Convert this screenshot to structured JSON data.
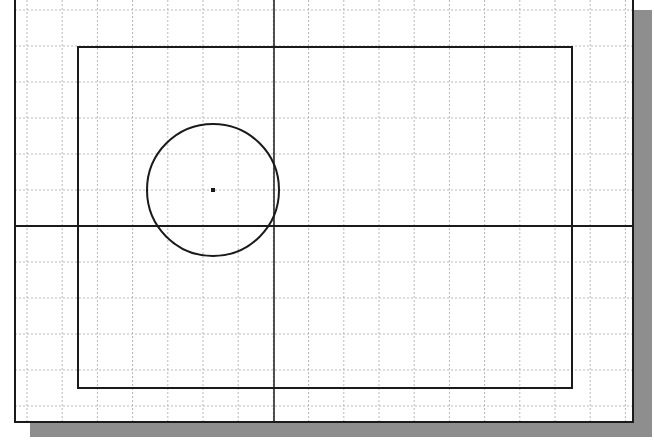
{
  "canvas": {
    "width": 654,
    "height": 446,
    "background": "#ffffff"
  },
  "colors": {
    "line": "#1a1a1a",
    "grid": "#b8b8b8",
    "shadow": "#8e8e8e"
  },
  "drawing_area": {
    "left": 15,
    "top": -4,
    "right": 633,
    "bottom": 422,
    "shadow": {
      "offset_x": 17,
      "offset_y": 15,
      "start_x": 30,
      "start_y": 10
    }
  },
  "grid": {
    "origin_x": 27,
    "step_x": 35.2,
    "origin_y": 10,
    "step_y": 36,
    "style": "dotted"
  },
  "axes": {
    "vertical_x": 274,
    "horizontal_y": 226
  },
  "rectangle": {
    "x1": 78,
    "y1": 47,
    "x2": 572,
    "y2": 388
  },
  "circle": {
    "cx": 213,
    "cy": 190,
    "r": 66
  },
  "center_point": {
    "x": 213,
    "y": 190,
    "size": 4
  }
}
